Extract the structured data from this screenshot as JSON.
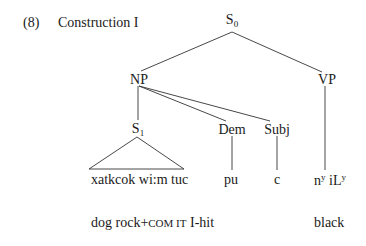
{
  "example": {
    "number": "(8)",
    "title": "Construction I"
  },
  "tree": {
    "root": {
      "label": "S",
      "subscript": "0"
    },
    "np": {
      "label": "NP"
    },
    "vp": {
      "label": "VP"
    },
    "s1": {
      "label": "S",
      "subscript": "1"
    },
    "dem": {
      "label": "Dem"
    },
    "subj": {
      "label": "Subj"
    }
  },
  "terminals": {
    "s1_words": "xatkcok wi:m tuc",
    "dem_word": "pu",
    "subj_word": "c",
    "vp_word_part1": "n",
    "vp_word_sup1": "y",
    "vp_word_part2": " iL",
    "vp_word_sup2": "y"
  },
  "gloss": {
    "s1_gloss_prefix": "dog rock+",
    "s1_gloss_smallcaps": "COM IT",
    "s1_gloss_suffix": " I-hit",
    "vp_gloss": "black"
  },
  "colors": {
    "ink": "#1a1a1a",
    "background": "#ffffff"
  }
}
